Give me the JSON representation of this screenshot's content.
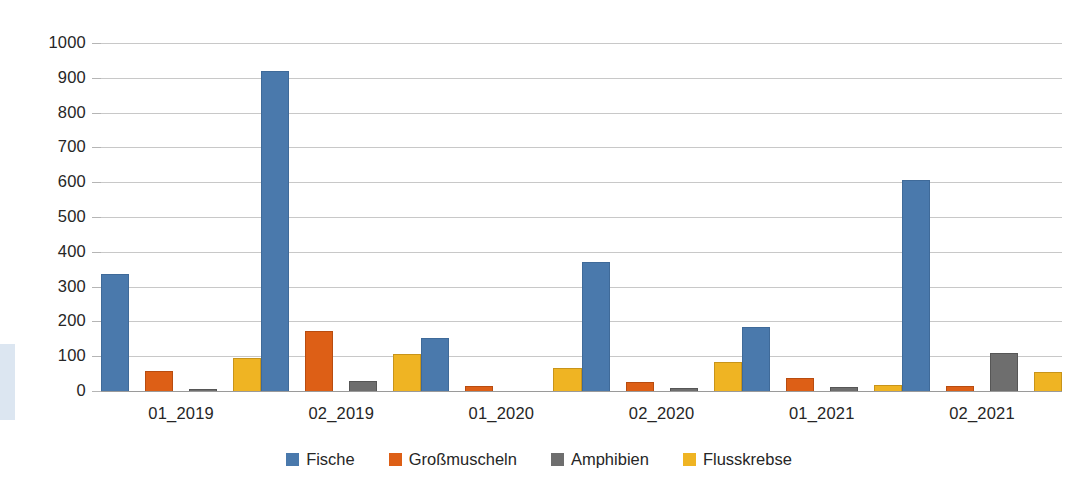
{
  "chart_data": {
    "type": "bar",
    "title": "",
    "subtitle": "",
    "xlabel": "",
    "ylabel": "",
    "categories": [
      "01_2019",
      "02_2019",
      "01_2020",
      "02_2020",
      "01_2021",
      "02_2021"
    ],
    "series": [
      {
        "name": "Fische",
        "color": "#4a79ac",
        "values": [
          335,
          920,
          152,
          370,
          185,
          605
        ]
      },
      {
        "name": "Großmuscheln",
        "color": "#dd5f16",
        "values": [
          58,
          172,
          15,
          26,
          37,
          14
        ]
      },
      {
        "name": "Amphibien",
        "color": "#6e6e6e",
        "values": [
          6,
          29,
          0,
          10,
          11,
          108
        ]
      },
      {
        "name": "Flusskrebse",
        "color": "#efb423",
        "values": [
          95,
          107,
          67,
          83,
          16,
          56
        ]
      }
    ],
    "ylim": [
      0,
      1000
    ],
    "ytick_step": 100,
    "yticks": [
      "0",
      "100",
      "200",
      "300",
      "400",
      "500",
      "600",
      "700",
      "800",
      "900",
      "1000"
    ],
    "grid": true,
    "grid_axis": "y",
    "legend_position": "bottom",
    "bar_mode": "grouped"
  },
  "legend": {
    "items": [
      {
        "label": "Fische",
        "swatch": "legend-swatch-fische"
      },
      {
        "label": "Großmuscheln",
        "swatch": "legend-swatch-grossmuscheln"
      },
      {
        "label": "Amphibien",
        "swatch": "legend-swatch-amphibien"
      },
      {
        "label": "Flusskrebse",
        "swatch": "legend-swatch-flusskrebse"
      }
    ]
  },
  "colors": {
    "fische": "#4a79ac",
    "grossmuscheln": "#dd5f16",
    "amphibien": "#6e6e6e",
    "flusskrebse": "#efb423",
    "gridline": "#c8c8c8",
    "axis": "#9a9a9a",
    "text": "#262626",
    "background": "#ffffff"
  }
}
